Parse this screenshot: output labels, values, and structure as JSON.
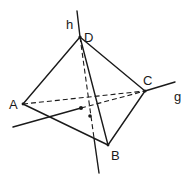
{
  "diagram": {
    "type": "tetrahedron-with-skew-lines",
    "vertices": {
      "A": {
        "label": "A"
      },
      "B": {
        "label": "B"
      },
      "C": {
        "label": "C"
      },
      "D": {
        "label": "D"
      }
    },
    "lines": {
      "h": {
        "label": "h",
        "through": [
          "D",
          "B-side"
        ]
      },
      "g": {
        "label": "g",
        "through": [
          "C",
          "A-side"
        ]
      }
    },
    "visible_edges": [
      "AD",
      "DC",
      "CB",
      "BA",
      "DB"
    ],
    "hidden_edges": [
      "AC"
    ],
    "marked_points": 2
  }
}
